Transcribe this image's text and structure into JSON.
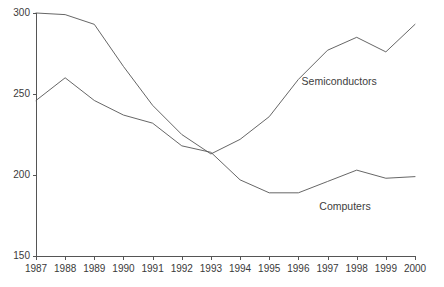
{
  "chart_data": {
    "type": "line",
    "title": "",
    "subtitle": "",
    "xlabel": "",
    "ylabel": "",
    "x": [
      1987,
      1988,
      1989,
      1990,
      1991,
      1992,
      1993,
      1994,
      1995,
      1996,
      1997,
      1998,
      1999,
      2000
    ],
    "categories": [
      "1987",
      "1988",
      "1989",
      "1990",
      "1991",
      "1992",
      "1993",
      "1994",
      "1995",
      "1996",
      "1997",
      "1998",
      "1999",
      "2000"
    ],
    "series": [
      {
        "name": "Semiconductors",
        "values": [
          300,
          299,
          293,
          267,
          243,
          225,
          213,
          222,
          236,
          259,
          277,
          285,
          276,
          293
        ],
        "color": "#555555",
        "label_x": 1997.4,
        "label_y": 258
      },
      {
        "name": "Computers",
        "values": [
          246,
          260,
          246,
          237,
          232,
          218,
          214,
          197,
          189,
          189,
          196,
          203,
          198,
          199
        ],
        "color": "#555555",
        "label_x": 1997.6,
        "label_y": 181
      }
    ],
    "xlim": [
      1987,
      2000
    ],
    "ylim": [
      150,
      300
    ],
    "yticks": [
      150,
      200,
      250,
      300
    ],
    "ytick_labels": [
      "150",
      "200",
      "250",
      "300"
    ],
    "xticks": [
      1987,
      1988,
      1989,
      1990,
      1991,
      1992,
      1993,
      1994,
      1995,
      1996,
      1997,
      1998,
      1999,
      2000
    ],
    "xtick_labels": [
      "1987",
      "1988",
      "1989",
      "1990",
      "1991",
      "1992",
      "1993",
      "1994",
      "1995",
      "1996",
      "1997",
      "1998",
      "1999",
      "2000"
    ],
    "grid": false,
    "legend_position": "inline-annotations",
    "axis_color": "#555555",
    "line_color": "#555555",
    "text_color": "#3a3a3a",
    "background": "#ffffff"
  },
  "plot_geometry": {
    "left": 36,
    "right": 415,
    "top": 13,
    "bottom": 256
  }
}
